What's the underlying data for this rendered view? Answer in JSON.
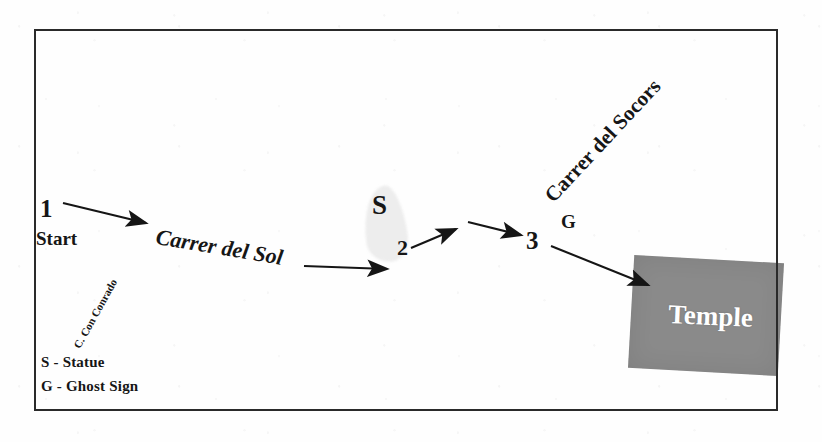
{
  "figure": {
    "type": "route-diagram",
    "background_color": "#fefefe",
    "frame_color": "#2a2a2a",
    "temple_fill": "#8a8a8a",
    "temple_text_color": "#ffffff",
    "statue_blob_color": "#ededed"
  },
  "nodes": [
    {
      "id": "1",
      "label": "1",
      "sub": "Start"
    },
    {
      "id": "2",
      "label": "2",
      "sub": ""
    },
    {
      "id": "3",
      "label": "3",
      "sub": ""
    }
  ],
  "streets": [
    {
      "name": "Carrer del Sol"
    },
    {
      "name": "Carrer del Socors"
    },
    {
      "name": "C. Con Conrado"
    }
  ],
  "markers": [
    {
      "symbol": "S",
      "meaning": "Statue"
    },
    {
      "symbol": "G",
      "meaning": "Ghost Sign"
    }
  ],
  "legend": [
    {
      "text": "S - Statue"
    },
    {
      "text": "G - Ghost Sign"
    }
  ],
  "destination": {
    "label": "Temple"
  },
  "labels": {
    "node_1": "1",
    "node_1_sub": "Start",
    "node_2": "2",
    "node_3": "3",
    "street_sol": "Carrer del Sol",
    "street_socors": "Carrer del Socors",
    "street_conrado": "C. Con Conrado",
    "marker_s": "S",
    "marker_g": "G",
    "legend_statue": "S - Statue",
    "legend_ghost": "G - Ghost Sign",
    "temple": "Temple"
  },
  "arrows": [
    {
      "from": "1",
      "to": "Carrer del Sol",
      "x1": 63,
      "y1": 203,
      "x2": 146,
      "y2": 223
    },
    {
      "from": "Carrer del Sol",
      "to": "2",
      "x1": 304,
      "y1": 266,
      "x2": 387,
      "y2": 269
    },
    {
      "from": "2",
      "to": "mid",
      "x1": 411,
      "y1": 248,
      "x2": 456,
      "y2": 229
    },
    {
      "from": "mid",
      "to": "3",
      "x1": 468,
      "y1": 222,
      "x2": 521,
      "y2": 235
    },
    {
      "from": "3",
      "to": "Temple",
      "x1": 551,
      "y1": 246,
      "x2": 648,
      "y2": 285
    }
  ]
}
